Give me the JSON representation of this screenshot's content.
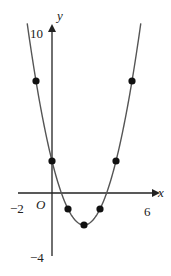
{
  "chart_data": {
    "type": "line",
    "title": "",
    "function": "y = x^2 - 4x + 2",
    "xlabel": "x",
    "ylabel": "y",
    "origin_label": "O",
    "xlim": [
      -2,
      6
    ],
    "ylim": [
      -4,
      10
    ],
    "x_tick_labels": [
      "-2",
      "6"
    ],
    "y_tick_labels": [
      "10",
      "-4"
    ],
    "grid": false,
    "legend": null,
    "marked_points": [
      {
        "x": -1,
        "y": 7
      },
      {
        "x": 0,
        "y": 2
      },
      {
        "x": 1,
        "y": -1
      },
      {
        "x": 2,
        "y": -2
      },
      {
        "x": 3,
        "y": -1
      },
      {
        "x": 4,
        "y": 2
      },
      {
        "x": 5,
        "y": 7
      }
    ],
    "colors": {
      "curve": "#555555",
      "axes": "#222222",
      "points": "#111111"
    }
  },
  "labels": {
    "x_axis": "x",
    "y_axis": "y",
    "origin": "O",
    "x_min": "−2",
    "x_max": "6",
    "y_max": "10",
    "y_min": "−4"
  }
}
